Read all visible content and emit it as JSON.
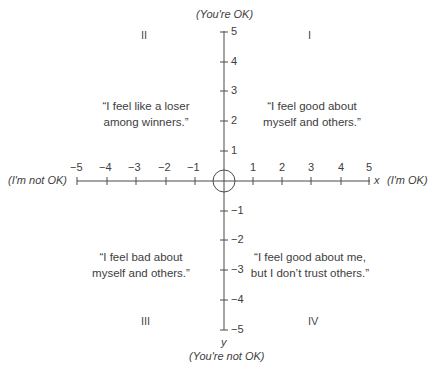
{
  "axes": {
    "x_label": "x",
    "y_label": "y",
    "x_positive": "(I'm OK)",
    "x_negative": "(I'm not OK)",
    "y_positive": "(You're OK)",
    "y_negative": "(You're not OK)",
    "x_ticks": [
      "−5",
      "−4",
      "−3",
      "−2",
      "−1",
      "1",
      "2",
      "3",
      "4",
      "5"
    ],
    "y_ticks_pos": [
      "5",
      "4",
      "3",
      "2",
      "1"
    ],
    "y_ticks_neg": [
      "−1",
      "−2",
      "−3",
      "−4",
      "−5"
    ]
  },
  "quadrants": [
    {
      "numeral": "I",
      "line1": "“I feel good about",
      "line2": "myself and others.”"
    },
    {
      "numeral": "II",
      "line1": "“I feel like a loser",
      "line2": "among winners.”"
    },
    {
      "numeral": "III",
      "line1": "“I feel bad about",
      "line2": "myself and others.”"
    },
    {
      "numeral": "IV",
      "line1": "“I feel good about me,",
      "line2": "but I don’t trust others.”"
    }
  ]
}
